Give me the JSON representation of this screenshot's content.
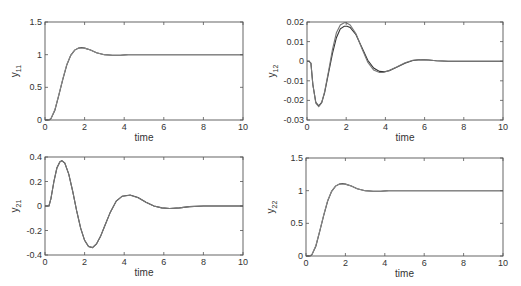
{
  "chart_data": [
    {
      "type": "line",
      "id": "y11",
      "title": "",
      "xlabel": "time",
      "ylabel": "y",
      "ylabel_sub": "11",
      "xlim": [
        0,
        10
      ],
      "ylim": [
        0,
        1.5
      ],
      "xticks": [
        0,
        2,
        4,
        6,
        8,
        10
      ],
      "xtick_labels": [
        "0",
        "2",
        "4",
        "6",
        "8",
        "10"
      ],
      "yticks": [
        0,
        0.5,
        1,
        1.5
      ],
      "ytick_labels": [
        "0",
        "0.5",
        "1",
        "1.5"
      ],
      "grid": false,
      "series": [
        {
          "name": "response-a",
          "color": "#333333",
          "x": [
            0,
            0.2,
            0.3,
            0.5,
            0.7,
            0.9,
            1.1,
            1.3,
            1.5,
            1.7,
            1.85,
            2.0,
            2.3,
            2.6,
            3.0,
            3.4,
            3.8,
            4.2,
            5,
            6,
            8,
            10
          ],
          "y": [
            0,
            0,
            0.02,
            0.15,
            0.38,
            0.62,
            0.84,
            0.99,
            1.07,
            1.1,
            1.11,
            1.1,
            1.07,
            1.03,
            1.0,
            0.99,
            0.99,
            1.0,
            1.0,
            1.0,
            1.0,
            1.0
          ]
        },
        {
          "name": "response-b",
          "color": "#888888",
          "x": [
            0,
            0.2,
            0.3,
            0.5,
            0.7,
            0.9,
            1.1,
            1.3,
            1.5,
            1.7,
            1.85,
            2.0,
            2.3,
            2.6,
            3.0,
            3.4,
            3.8,
            4.2,
            5,
            6,
            8,
            10
          ],
          "y": [
            0,
            0,
            0.02,
            0.16,
            0.39,
            0.63,
            0.85,
            0.99,
            1.07,
            1.1,
            1.1,
            1.1,
            1.07,
            1.03,
            1.0,
            0.99,
            0.99,
            1.0,
            1.0,
            1.0,
            1.0,
            1.0
          ]
        }
      ]
    },
    {
      "type": "line",
      "id": "y12",
      "title": "",
      "xlabel": "time",
      "ylabel": "y",
      "ylabel_sub": "12",
      "xlim": [
        0,
        10
      ],
      "ylim": [
        -0.03,
        0.02
      ],
      "xticks": [
        0,
        2,
        4,
        6,
        8,
        10
      ],
      "xtick_labels": [
        "0",
        "2",
        "4",
        "6",
        "8",
        "10"
      ],
      "yticks": [
        -0.03,
        -0.02,
        -0.01,
        0,
        0.01,
        0.02
      ],
      "ytick_labels": [
        "-0.03",
        "-0.02",
        "-0.01",
        "0",
        "0.01",
        "0.02"
      ],
      "grid": false,
      "series": [
        {
          "name": "response-a",
          "color": "#333333",
          "x": [
            0,
            0.1,
            0.2,
            0.3,
            0.45,
            0.6,
            0.75,
            0.9,
            1.1,
            1.3,
            1.5,
            1.7,
            1.9,
            2.05,
            2.2,
            2.5,
            2.8,
            3.1,
            3.4,
            3.7,
            3.95,
            4.2,
            4.6,
            5.0,
            5.4,
            5.8,
            6.2,
            6.6,
            7.2,
            8,
            9,
            10
          ],
          "y": [
            0,
            0,
            -0.001,
            -0.012,
            -0.021,
            -0.0228,
            -0.021,
            -0.016,
            -0.006,
            0.004,
            0.012,
            0.0165,
            0.0178,
            0.0178,
            0.0172,
            0.0135,
            0.007,
            0.0005,
            -0.0035,
            -0.0052,
            -0.0054,
            -0.0048,
            -0.003,
            -0.001,
            0.0004,
            0.0008,
            0.0006,
            0.0002,
            0,
            0,
            0,
            0
          ]
        },
        {
          "name": "response-b",
          "color": "#777777",
          "x": [
            0,
            0.1,
            0.2,
            0.3,
            0.45,
            0.6,
            0.75,
            0.9,
            1.1,
            1.3,
            1.5,
            1.7,
            1.9,
            2.0,
            2.2,
            2.5,
            2.8,
            3.1,
            3.4,
            3.7,
            3.9,
            4.2,
            4.6,
            5.0,
            5.4,
            5.8,
            6.2,
            6.6,
            7.2,
            8,
            9,
            10
          ],
          "y": [
            0,
            0,
            -0.001,
            -0.012,
            -0.0215,
            -0.0232,
            -0.0212,
            -0.0155,
            -0.005,
            0.006,
            0.0145,
            0.0185,
            0.0196,
            0.0196,
            0.0185,
            0.014,
            0.0065,
            -0.0005,
            -0.0045,
            -0.0058,
            -0.0058,
            -0.0048,
            -0.0028,
            -0.0008,
            0.0005,
            0.0009,
            0.0006,
            0.0002,
            0,
            0,
            0,
            0
          ]
        }
      ]
    },
    {
      "type": "line",
      "id": "y21",
      "title": "",
      "xlabel": "time",
      "ylabel": "y",
      "ylabel_sub": "21",
      "xlim": [
        0,
        10
      ],
      "ylim": [
        -0.4,
        0.4
      ],
      "xticks": [
        0,
        2,
        4,
        6,
        8,
        10
      ],
      "xtick_labels": [
        "0",
        "2",
        "4",
        "6",
        "8",
        "10"
      ],
      "yticks": [
        -0.4,
        -0.2,
        0,
        0.2,
        0.4
      ],
      "ytick_labels": [
        "-0.4",
        "-0.2",
        "0",
        "0.2",
        "0.4"
      ],
      "grid": false,
      "series": [
        {
          "name": "response-a",
          "color": "#333333",
          "x": [
            0,
            0.2,
            0.3,
            0.45,
            0.6,
            0.75,
            0.85,
            1.0,
            1.2,
            1.4,
            1.6,
            1.8,
            2.0,
            2.2,
            2.4,
            2.6,
            2.8,
            3.0,
            3.3,
            3.6,
            3.9,
            4.3,
            4.7,
            5.1,
            5.5,
            5.9,
            6.3,
            6.8,
            7.3,
            8,
            9,
            10
          ],
          "y": [
            0,
            0,
            0.06,
            0.2,
            0.31,
            0.36,
            0.37,
            0.35,
            0.26,
            0.12,
            -0.04,
            -0.18,
            -0.28,
            -0.33,
            -0.34,
            -0.31,
            -0.25,
            -0.17,
            -0.05,
            0.04,
            0.08,
            0.09,
            0.07,
            0.03,
            0.0,
            -0.015,
            -0.02,
            -0.015,
            -0.005,
            0,
            0,
            0
          ]
        },
        {
          "name": "response-b",
          "color": "#777777",
          "x": [
            0,
            0.2,
            0.3,
            0.45,
            0.6,
            0.75,
            0.85,
            1.0,
            1.2,
            1.4,
            1.6,
            1.8,
            2.0,
            2.2,
            2.4,
            2.6,
            2.8,
            3.0,
            3.3,
            3.6,
            3.9,
            4.3,
            4.7,
            5.1,
            5.5,
            5.9,
            6.3,
            6.8,
            7.3,
            8,
            9,
            10
          ],
          "y": [
            0,
            0,
            0.06,
            0.2,
            0.31,
            0.36,
            0.37,
            0.35,
            0.26,
            0.12,
            -0.04,
            -0.18,
            -0.28,
            -0.33,
            -0.34,
            -0.31,
            -0.25,
            -0.17,
            -0.05,
            0.04,
            0.08,
            0.088,
            0.068,
            0.03,
            0.0,
            -0.015,
            -0.02,
            -0.015,
            -0.005,
            0,
            0,
            0
          ]
        }
      ]
    },
    {
      "type": "line",
      "id": "y22",
      "title": "",
      "xlabel": "time",
      "ylabel": "y",
      "ylabel_sub": "22",
      "xlim": [
        0,
        10
      ],
      "ylim": [
        0,
        1.5
      ],
      "xticks": [
        0,
        2,
        4,
        6,
        8,
        10
      ],
      "xtick_labels": [
        "0",
        "2",
        "4",
        "6",
        "8",
        "10"
      ],
      "yticks": [
        0,
        0.5,
        1,
        1.5
      ],
      "ytick_labels": [
        "0",
        "0.5",
        "1",
        "1.5"
      ],
      "grid": false,
      "series": [
        {
          "name": "response-a",
          "color": "#333333",
          "x": [
            0,
            0.2,
            0.3,
            0.5,
            0.7,
            0.9,
            1.1,
            1.3,
            1.5,
            1.7,
            1.85,
            2.0,
            2.3,
            2.6,
            3.0,
            3.4,
            3.8,
            4.2,
            5,
            6,
            8,
            10
          ],
          "y": [
            0,
            0,
            0.02,
            0.15,
            0.38,
            0.62,
            0.84,
            0.99,
            1.07,
            1.1,
            1.11,
            1.1,
            1.07,
            1.03,
            1.0,
            0.99,
            0.99,
            1.0,
            1.0,
            1.0,
            1.0,
            1.0
          ]
        },
        {
          "name": "response-b",
          "color": "#888888",
          "x": [
            0,
            0.2,
            0.3,
            0.5,
            0.7,
            0.9,
            1.1,
            1.3,
            1.5,
            1.7,
            1.85,
            2.0,
            2.3,
            2.6,
            3.0,
            3.4,
            3.8,
            4.2,
            5,
            6,
            8,
            10
          ],
          "y": [
            0,
            0,
            0.02,
            0.16,
            0.39,
            0.63,
            0.85,
            0.99,
            1.07,
            1.1,
            1.1,
            1.1,
            1.07,
            1.03,
            1.0,
            0.99,
            0.99,
            1.0,
            1.0,
            1.0,
            1.0,
            1.0
          ]
        }
      ]
    }
  ]
}
